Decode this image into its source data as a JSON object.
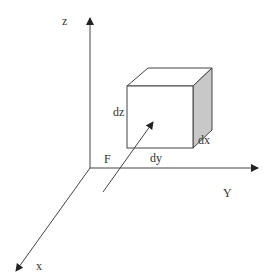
{
  "diagram": {
    "axes": {
      "z": {
        "label": "z"
      },
      "y": {
        "label": "Y"
      },
      "x": {
        "label": "x"
      }
    },
    "origin_label": "F",
    "cube": {
      "height_label": "dz",
      "depth_label": "dx",
      "width_label": "dy",
      "side_fill": "#c8c8c8"
    },
    "colors": {
      "stroke": "#333333",
      "background": "#ffffff"
    }
  }
}
